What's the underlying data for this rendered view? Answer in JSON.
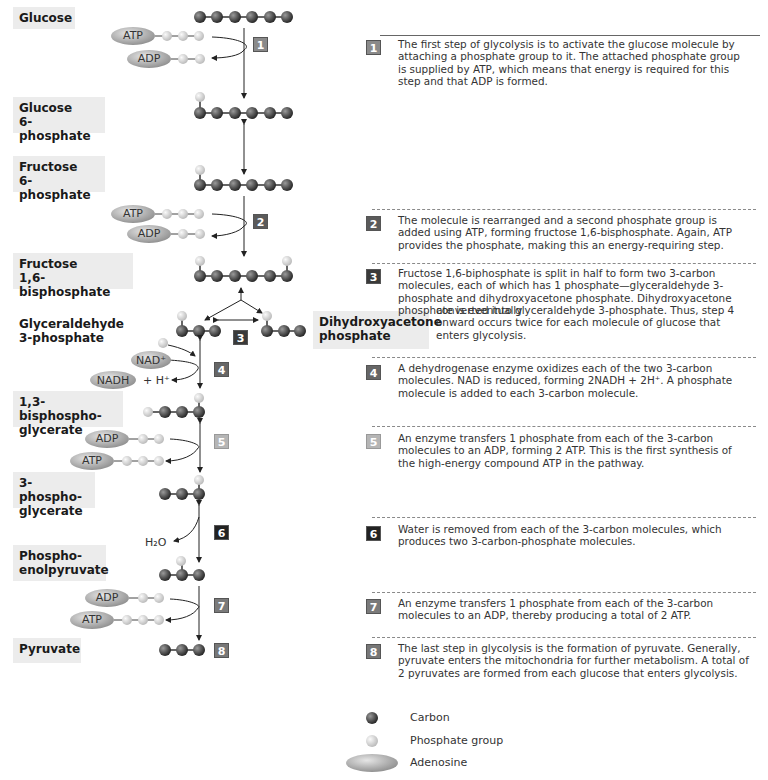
{
  "diagram": {
    "title": "Glycolysis",
    "stages": [
      {
        "id": "glucose",
        "line1": "Glucose",
        "line2": ""
      },
      {
        "id": "g6p",
        "line1": "Glucose",
        "line2": "6-phosphate"
      },
      {
        "id": "f6p",
        "line1": "Fructose",
        "line2": "6-phosphate"
      },
      {
        "id": "f16bp",
        "line1": "Fructose",
        "line2": "1,6-bisphosphate"
      },
      {
        "id": "g3p",
        "line1": "Glyceraldehyde",
        "line2": "3-phosphate"
      },
      {
        "id": "dhap",
        "line1": "Dihydroxyacetone",
        "line2": "phosphate"
      },
      {
        "id": "bpg",
        "line1": "1,3-bisphospho-",
        "line2": "glycerate"
      },
      {
        "id": "pg3",
        "line1": "3-phospho-",
        "line2": "glycerate"
      },
      {
        "id": "pep",
        "line1": "Phospho-",
        "line2": "enolpyruvate"
      },
      {
        "id": "pyruvate",
        "line1": "Pyruvate",
        "line2": ""
      }
    ],
    "molecule_labels": {
      "atp": "ATP",
      "adp": "ADP",
      "nad_plus": "NAD⁺",
      "nadh": "NADH",
      "h_plus": "+ H⁺",
      "water": "H₂O"
    },
    "steps": [
      {
        "number": "1",
        "color": "#8a8a8a",
        "text": "The first step of glycolysis is to activate the glucose molecule by attaching a phosphate group to it. The attached phosphate group is supplied by ATP, which means that energy is required for this step and that ADP is formed."
      },
      {
        "number": "2",
        "color": "#5a5a5a",
        "text": "The molecule is rearranged and a second phosphate group is added using ATP, forming fructose 1,6-bisphosphate. Again, ATP provides the phosphate, making this an energy-requiring step."
      },
      {
        "number": "3",
        "color": "#3a3a3a",
        "text": "Fructose 1,6-biphosphate is split in half to form two 3-carbon molecules, each of which has 1 phosphate—glyceraldehyde 3-phosphate and dihydroxyacetone phosphate. Dihydroxyacetone phosphate is eventually converted into glyceraldehyde 3-phosphate. Thus, step 4 onward occurs twice for each molecule of glucose that enters glycolysis.",
        "text_a": "Fructose 1,6-biphosphate is split in half to form two 3-carbon molecules, each of which has 1 phosphate—glyceraldehyde 3-phosphate and dihydroxyacetone phosphate. Dihydroxyacetone phosphate is eventually",
        "text_b": "converted into glyceraldehyde 3-phosphate. Thus, step 4 onward occurs twice for each molecule of glucose that enters glycolysis."
      },
      {
        "number": "4",
        "color": "#666666",
        "text": "A dehydrogenase enzyme oxidizes each of the two 3-carbon molecules. NAD is reduced, forming 2NADH + 2H⁺. A phosphate molecule is added to each 3-carbon molecule."
      },
      {
        "number": "5",
        "color": "#b5b5b5",
        "text": "An enzyme transfers 1 phosphate from each of the 3-carbon molecules to an ADP, forming 2 ATP. This is the first synthesis of the high-energy compound ATP in the pathway."
      },
      {
        "number": "6",
        "color": "#222222",
        "text": "Water is removed from each of the 3-carbon molecules, which produces two 3-carbon-phosphate molecules."
      },
      {
        "number": "7",
        "color": "#7a7a7a",
        "text": "An enzyme transfers 1 phosphate from each of the 3-carbon molecules to an ADP, thereby producing a total of 2 ATP."
      },
      {
        "number": "8",
        "color": "#777777",
        "text": "The last step in glycolysis is the formation of pyruvate. Generally, pyruvate enters the mitochondria for further metabolism. A total of 2 pyruvates are formed from each glucose that enters glycolysis."
      }
    ],
    "legend": [
      {
        "icon": "carbon-sphere-icon",
        "label": "Carbon"
      },
      {
        "icon": "phosphate-sphere-icon",
        "label": "Phosphate group"
      },
      {
        "icon": "adenosine-ellipse-icon",
        "label": "Adenosine"
      }
    ],
    "colors": {
      "carbon": "#5a5a5a",
      "phosphate": "#d8d8d8",
      "adenosine": "#a8a8a8",
      "label_bg": "#ececec"
    }
  }
}
